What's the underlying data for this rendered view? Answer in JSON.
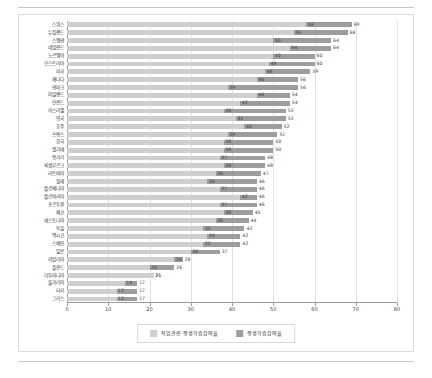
{
  "chart_data": {
    "type": "bar",
    "orientation": "horizontal",
    "title": "",
    "xlabel": "",
    "ylabel": "",
    "xlim": [
      0,
      80
    ],
    "xticks": [
      0,
      10,
      20,
      30,
      40,
      50,
      60,
      70,
      80
    ],
    "grid": true,
    "legend_position": "bottom",
    "categories": [
      "스위스",
      "뉴질랜드",
      "스웨덴",
      "네덜란드",
      "노르웨이",
      "오스트리아",
      "미국",
      "캐나다",
      "덴마크",
      "아일랜드",
      "핀란드",
      "이스라엘",
      "영국",
      "호주",
      "프랑스",
      "한국",
      "벨기에",
      "헝가리",
      "룩셈부르크",
      "라트비아",
      "칠레",
      "슬로베니아",
      "슬로바키아",
      "포르투갈",
      "체코",
      "에스토니아",
      "독일",
      "멕시코",
      "스페인",
      "일본",
      "이탈리아",
      "폴란드",
      "리투아니아",
      "불가리아",
      "터키",
      "그리스"
    ],
    "series": [
      {
        "name": "평생학습참여율",
        "color": "#9d9d9d",
        "values": [
          69,
          68,
          64,
          64,
          60,
          60,
          59,
          56,
          56,
          54,
          54,
          53,
          53,
          52,
          51,
          50,
          50,
          48,
          48,
          47,
          46,
          46,
          46,
          46,
          45,
          44,
          43,
          42,
          42,
          37,
          28,
          26,
          21,
          17,
          17,
          17
        ]
      },
      {
        "name": "직업관련 평생학습참여율",
        "color": "#cfcfcf",
        "values": [
          58,
          55,
          50,
          54,
          50,
          49,
          48,
          46,
          39,
          46,
          42,
          38,
          41,
          43,
          39,
          38,
          38,
          37,
          38,
          36,
          34,
          37,
          42,
          37,
          38,
          36,
          33,
          34,
          33,
          30,
          26,
          20,
          21,
          14,
          12,
          12
        ]
      }
    ]
  },
  "legend": {
    "items": [
      {
        "label": "직업관련 평생학습참여율"
      },
      {
        "label": "평생학습참여율"
      }
    ]
  }
}
